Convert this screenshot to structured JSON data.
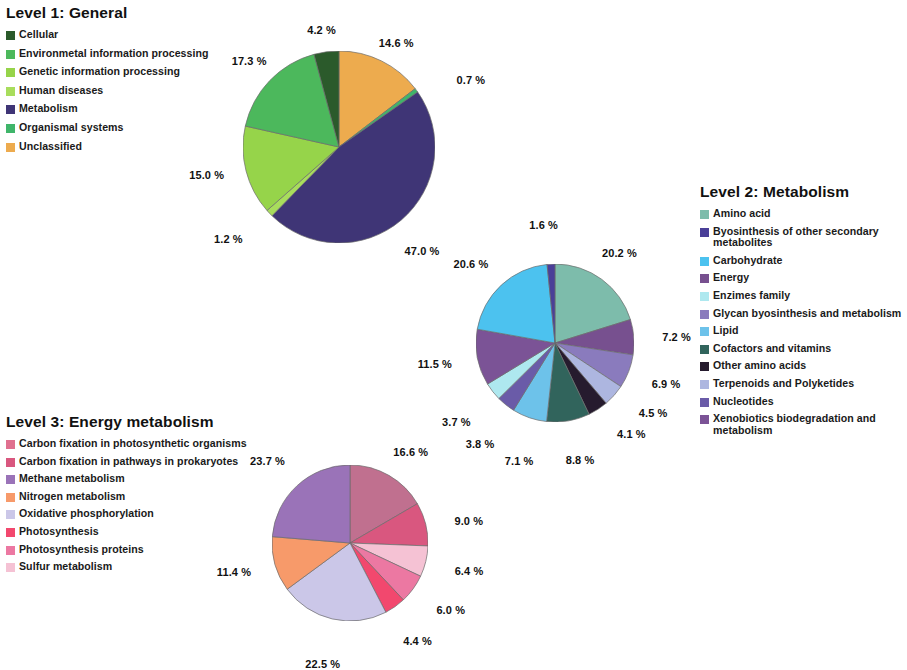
{
  "charts": [
    {
      "id": "level1",
      "title": "Level 1: General",
      "legend": [
        {
          "label": "Cellular",
          "color": "#2b5a2b"
        },
        {
          "label": "Environmetal information processing",
          "color": "#4cb85c"
        },
        {
          "label": "Genetic information processing",
          "color": "#96d44a"
        },
        {
          "label": "Human diseases",
          "color": "#a8dd5c"
        },
        {
          "label": "Metabolism",
          "color": "#3f3576"
        },
        {
          "label": "Organismal systems",
          "color": "#3fb56a"
        },
        {
          "label": "Unclassified",
          "color": "#edab4e"
        }
      ],
      "labels": [
        "4.2 %",
        "14.6 %",
        "0.7 %",
        "47.0 %",
        "1.2 %",
        "15.0 %",
        "17.3 %"
      ]
    },
    {
      "id": "level2",
      "title": "Level 2: Metabolism",
      "legend": [
        {
          "label": "Amino acid",
          "color": "#7dbcab"
        },
        {
          "label": "Byosinthesis of other secondary metabolites",
          "color": "#4a3f98"
        },
        {
          "label": "Carbohydrate",
          "color": "#4cc2ef"
        },
        {
          "label": "Energy",
          "color": "#77508f"
        },
        {
          "label": "Enzimes family",
          "color": "#aee8ef"
        },
        {
          "label": "Glycan byosinthesis and metabolism",
          "color": "#8a7bbd"
        },
        {
          "label": "Lipid",
          "color": "#6dc2ea"
        },
        {
          "label": "Cofactors and vitamins",
          "color": "#31645c"
        },
        {
          "label": "Other amino acids",
          "color": "#261b2e"
        },
        {
          "label": "Terpenoids and Polyketides",
          "color": "#adb6e0"
        },
        {
          "label": "Nucleotides",
          "color": "#6a5ba8"
        },
        {
          "label": "Xenobiotics biodegradation and metabolism",
          "color": "#7b5396"
        }
      ],
      "labels": [
        "1.6 %",
        "20.2 %",
        "7.2 %",
        "6.9 %",
        "4.5 %",
        "4.1 %",
        "8.8 %",
        "7.1 %",
        "3.8 %",
        "3.7 %",
        "11.5 %",
        "20.6 %"
      ]
    },
    {
      "id": "level3",
      "title": "Level 3: Energy metabolism",
      "legend": [
        {
          "label": "Carbon fixation in photosynthetic organisms",
          "color": "#e0708f"
        },
        {
          "label": "Carbon fixation in pathways in prokaryotes",
          "color": "#d9577f"
        },
        {
          "label": "Methane metabolism",
          "color": "#9a73b8"
        },
        {
          "label": "Nitrogen metabolism",
          "color": "#f79a6a"
        },
        {
          "label": "Oxidative phosphorylation",
          "color": "#cbc7e8"
        },
        {
          "label": "Photosynthesis",
          "color": "#f2486e"
        },
        {
          "label": "Photosynthesis proteins",
          "color": "#ec78a2"
        },
        {
          "label": "Sulfur metabolism",
          "color": "#f5c2d4"
        }
      ],
      "labels": [
        "16.6 %",
        "9.0 %",
        "6.4 %",
        "6.0 %",
        "4.4 %",
        "22.5 %",
        "11.4 %",
        "23.7 %"
      ]
    }
  ],
  "chart_data": [
    {
      "type": "pie",
      "title": "Level 1: General",
      "legend_position": "top-left",
      "categories": [
        "Unclassified",
        "Organismal systems",
        "Metabolism",
        "Human diseases",
        "Genetic information processing",
        "Environmetal information processing",
        "Cellular"
      ],
      "values": [
        14.6,
        0.7,
        47.0,
        1.2,
        15.0,
        17.3,
        4.2
      ],
      "value_labels": [
        "14.6 %",
        "0.7 %",
        "47.0 %",
        "1.2 %",
        "15.0 %",
        "17.3 %",
        "4.2 %"
      ],
      "colors": [
        "#edab4e",
        "#3fb56a",
        "#3f3576",
        "#a8dd5c",
        "#96d44a",
        "#4cb85c",
        "#2b5a2b"
      ],
      "units": "percent",
      "start_angle_deg": 0,
      "direction": "clockwise"
    },
    {
      "type": "pie",
      "title": "Level 2: Metabolism",
      "legend_position": "right",
      "categories": [
        "Amino acid",
        "Energy",
        "Glycan byosinthesis and metabolism",
        "Terpenoids and Polyketides",
        "Other amino acids",
        "Cofactors and vitamins",
        "Lipid",
        "Nucleotides",
        "Enzimes family",
        "Xenobiotics biodegradation and metabolism",
        "Carbohydrate",
        "Byosinthesis of other secondary metabolites"
      ],
      "values": [
        20.2,
        7.2,
        6.9,
        4.5,
        4.1,
        8.8,
        7.1,
        3.8,
        3.7,
        11.5,
        20.6,
        1.6
      ],
      "value_labels": [
        "20.2 %",
        "7.2 %",
        "6.9 %",
        "4.5 %",
        "4.1 %",
        "8.8 %",
        "7.1 %",
        "3.8 %",
        "3.7 %",
        "11.5 %",
        "20.6 %",
        "1.6 %"
      ],
      "colors": [
        "#7dbcab",
        "#77508f",
        "#8a7bbd",
        "#adb6e0",
        "#261b2e",
        "#31645c",
        "#6dc2ea",
        "#6a5ba8",
        "#aee8ef",
        "#7b5396",
        "#4cc2ef",
        "#4a3f98"
      ],
      "units": "percent",
      "start_angle_deg": 0,
      "direction": "clockwise"
    },
    {
      "type": "pie",
      "title": "Level 3: Energy metabolism",
      "legend_position": "left",
      "categories": [
        "Carbon fixation in photosynthetic organisms",
        "Carbon fixation in pathways in prokaryotes",
        "Sulfur metabolism",
        "Photosynthesis proteins",
        "Photosynthesis",
        "Oxidative phosphorylation",
        "Nitrogen metabolism",
        "Methane metabolism"
      ],
      "values": [
        16.6,
        9.0,
        6.4,
        6.0,
        4.4,
        22.5,
        11.4,
        23.7
      ],
      "value_labels": [
        "16.6 %",
        "9.0 %",
        "6.4 %",
        "6.0 %",
        "4.4 %",
        "22.5 %",
        "11.4 %",
        "23.7 %"
      ],
      "colors": [
        "#c0708f",
        "#d9577f",
        "#f5c2d4",
        "#ec78a2",
        "#f2486e",
        "#cbc7e8",
        "#f79a6a",
        "#9a73b8"
      ],
      "units": "percent",
      "start_angle_deg": 0,
      "direction": "clockwise"
    }
  ]
}
